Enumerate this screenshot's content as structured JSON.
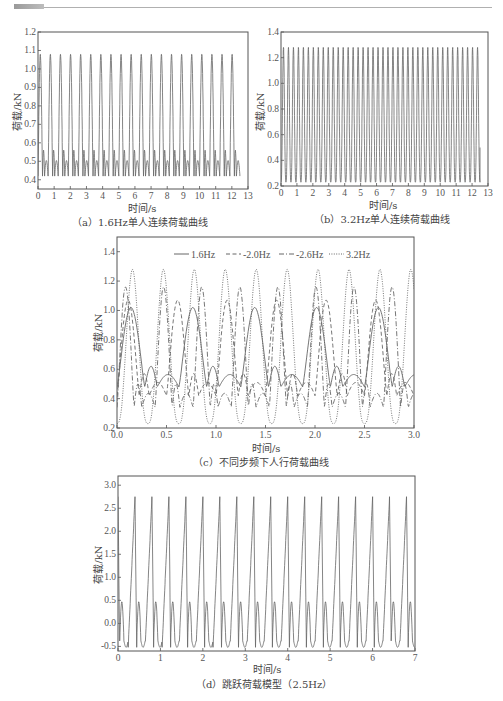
{
  "header": {
    "accent_color": "#a8a8a8",
    "rule_color": "#b0b0b0"
  },
  "chart_data": [
    {
      "id": "a",
      "type": "line",
      "caption": "（a）1.6Hz单人连续荷载曲线",
      "title": "",
      "xlabel": "时间/s",
      "ylabel": "荷载/kN",
      "xlim": [
        0,
        13
      ],
      "ylim": [
        0.35,
        1.2
      ],
      "xticks": [
        0,
        1,
        2,
        3,
        4,
        5,
        6,
        7,
        8,
        9,
        10,
        11,
        12,
        13
      ],
      "yticks": [
        0.4,
        0.5,
        0.6,
        0.7,
        0.8,
        0.9,
        1.0,
        1.1,
        1.2
      ],
      "grid": false,
      "series": [
        {
          "name": "1.6Hz",
          "frequency_hz": 1.6,
          "peak": 1.08,
          "trough": 0.42,
          "mid_hump": 0.56,
          "mid_dip": 0.5,
          "duration_s": 12.5,
          "style": "solid"
        }
      ]
    },
    {
      "id": "b",
      "type": "line",
      "caption": "（b）3.2Hz单人连续荷载曲线",
      "title": "",
      "xlabel": "时间/s",
      "ylabel": "荷载/kN",
      "xlim": [
        0,
        13
      ],
      "ylim": [
        0.2,
        1.4
      ],
      "xticks": [
        0,
        1,
        2,
        3,
        4,
        5,
        6,
        7,
        8,
        9,
        10,
        11,
        12,
        13
      ],
      "yticks": [
        0.2,
        0.4,
        0.6,
        0.8,
        1.0,
        1.2,
        1.4
      ],
      "grid": false,
      "series": [
        {
          "name": "3.2Hz",
          "frequency_hz": 3.2,
          "peak": 1.28,
          "trough": 0.23,
          "duration_s": 12.5,
          "end_value": 0.5,
          "style": "solid"
        }
      ]
    },
    {
      "id": "c",
      "type": "line",
      "caption": "（c）不同步频下人行荷载曲线",
      "title": "",
      "xlabel": "时间/s",
      "ylabel": "荷载/kN",
      "xlim": [
        0,
        3.0
      ],
      "ylim": [
        0.2,
        1.5
      ],
      "xticks": [
        0.0,
        0.5,
        1.0,
        1.5,
        2.0,
        2.5,
        3.0
      ],
      "yticks": [
        0.2,
        0.4,
        0.6,
        0.8,
        1.0,
        1.2,
        1.4
      ],
      "grid": false,
      "legend": {
        "position": "top",
        "entries": [
          "1.6Hz",
          "2.0Hz",
          "2.6Hz",
          "3.2Hz"
        ]
      },
      "series": [
        {
          "name": "1.6Hz",
          "style": "solid",
          "frequency_hz": 1.6,
          "peak": 1.02,
          "trough": 0.48,
          "mid_hump": 0.62
        },
        {
          "name": "2.0Hz",
          "style": "dashed",
          "frequency_hz": 2.0,
          "peak": 1.07,
          "trough": 0.42,
          "mid_hump": 0.57
        },
        {
          "name": "2.6Hz",
          "style": "dashdot",
          "frequency_hz": 2.6,
          "peak": 1.16,
          "trough": 0.34,
          "mid_hump": 0.5
        },
        {
          "name": "3.2Hz",
          "style": "dotted",
          "frequency_hz": 3.2,
          "peak": 1.28,
          "trough": 0.23
        }
      ]
    },
    {
      "id": "d",
      "type": "line",
      "caption": "（d）跳跃荷载模型（2.5Hz）",
      "title": "",
      "xlabel": "时间/s",
      "ylabel": "荷载/kN",
      "xlim": [
        0,
        7
      ],
      "ylim": [
        -0.6,
        3.2
      ],
      "xticks": [
        0,
        1,
        2,
        3,
        4,
        5,
        6,
        7
      ],
      "yticks": [
        -0.5,
        0.0,
        0.5,
        1.0,
        1.5,
        2.0,
        2.5,
        3.0
      ],
      "grid": false,
      "series": [
        {
          "name": "2.5Hz jump",
          "frequency_hz": 2.5,
          "peak": 2.75,
          "secondary_peak": 0.47,
          "trough": -0.52,
          "shallow_trough": -0.38,
          "style": "solid"
        }
      ]
    }
  ],
  "labels": {
    "a": {
      "caption": "（a）1.6Hz单人连续荷载曲线",
      "xlabel": "时间/s",
      "ylabel": "荷载/kN"
    },
    "b": {
      "caption": "（b）3.2Hz单人连续荷载曲线",
      "xlabel": "时间/s",
      "ylabel": "荷载/kN"
    },
    "c": {
      "caption": "（c）不同步频下人行荷载曲线",
      "xlabel": "时间/s",
      "ylabel": "荷载/kN",
      "legend": [
        "1.6Hz",
        "-2.0Hz",
        "-2.6Hz",
        "3.2Hz"
      ]
    },
    "d": {
      "caption": "（d）跳跃荷载模型（2.5Hz）",
      "xlabel": "时间/s",
      "ylabel": "荷载/kN"
    }
  }
}
